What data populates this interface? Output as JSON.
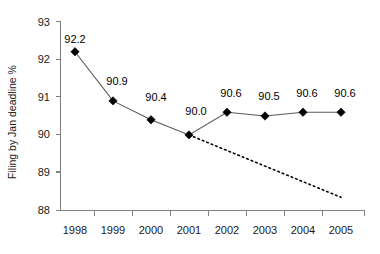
{
  "chart_data": {
    "type": "line",
    "title": "",
    "subtitle": "",
    "xlabel": "",
    "ylabel": "Filing by Jan deadline %",
    "categories": [
      "1998",
      "1999",
      "2000",
      "2001",
      "2002",
      "2003",
      "2004",
      "2005"
    ],
    "values": [
      92.2,
      90.9,
      90.4,
      90.0,
      90.6,
      90.5,
      90.6,
      90.6
    ],
    "point_labels": [
      "92.2",
      "90.9",
      "90.4",
      "90.0",
      "90.6",
      "90.5",
      "90.6",
      "90.6"
    ],
    "series": [
      {
        "name": "Filing by Jan deadline %",
        "values": [
          92.2,
          90.9,
          90.4,
          90.0,
          90.6,
          90.5,
          90.6,
          90.6
        ],
        "style": "solid",
        "marker": "diamond",
        "color": "#000000"
      },
      {
        "name": "trend",
        "x": [
          "2001",
          "2005"
        ],
        "values": [
          90.0,
          88.35
        ],
        "style": "dotted",
        "marker": "none",
        "color": "#000000"
      }
    ],
    "ylim": [
      88,
      93
    ],
    "ytick_labels": [
      "88",
      "89",
      "90",
      "91",
      "92",
      "93"
    ],
    "yticks": [
      88,
      89,
      90,
      91,
      92,
      93
    ],
    "grid": false,
    "legend": "none",
    "legend_position": "none",
    "colors": {
      "axis": "#808080",
      "line": "#595959",
      "marker": "#000000",
      "trend": "#000000",
      "text": "#1a1a1a",
      "background": "#ffffff"
    }
  },
  "axes": {
    "y_axis_title": "Filing by Jan deadline %"
  }
}
